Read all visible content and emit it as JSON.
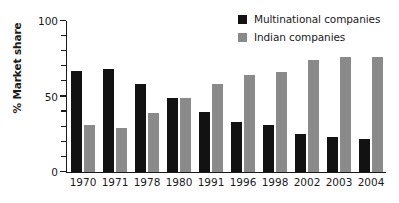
{
  "chart_data": {
    "type": "bar",
    "title": "",
    "subtitle": "",
    "xlabel": "",
    "ylabel": "% Market share",
    "ylim": [
      0,
      100
    ],
    "yticks": [
      0,
      50,
      100
    ],
    "ytick_labels": [
      "0",
      "50",
      "100"
    ],
    "yminor_step": 10,
    "grid": false,
    "legend_position": "top-right",
    "categories": [
      "1970",
      "1971",
      "1978",
      "1980",
      "1991",
      "1996",
      "1998",
      "2002",
      "2003",
      "2004"
    ],
    "series": [
      {
        "name": "Multinational companies",
        "color": "#121212",
        "values": [
          67,
          68,
          58,
          49,
          40,
          33,
          31,
          25,
          23,
          22
        ]
      },
      {
        "name": "Indian companies",
        "color": "#8a8a8a",
        "values": [
          31,
          29,
          39,
          49,
          58,
          64,
          66,
          74,
          76,
          76
        ]
      }
    ],
    "annotations": []
  },
  "legend": {
    "entries": [
      {
        "label": "Multinational companies",
        "swatch": "legend-swatch-multinational"
      },
      {
        "label": "Indian companies",
        "swatch": "legend-swatch-indian"
      }
    ]
  },
  "axes": {
    "y_title": "% Market share"
  },
  "colors": {
    "multinational": "#121212",
    "indian": "#8a8a8a",
    "axis": "#1a1a1a",
    "background": "#ffffff"
  }
}
